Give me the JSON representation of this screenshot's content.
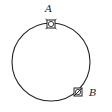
{
  "diagram": {
    "type": "circle-with-points",
    "circle": {
      "cx": 51,
      "cy": 62,
      "r": 39,
      "stroke": "#222222"
    },
    "points": [
      {
        "label": "A",
        "x": 51,
        "y": 24,
        "marker": "square-with-circle",
        "label_x": 45,
        "label_y": 4
      },
      {
        "label": "B",
        "x": 78,
        "y": 92,
        "marker": "square-with-diagonal",
        "label_x": 89,
        "label_y": 88
      }
    ]
  }
}
